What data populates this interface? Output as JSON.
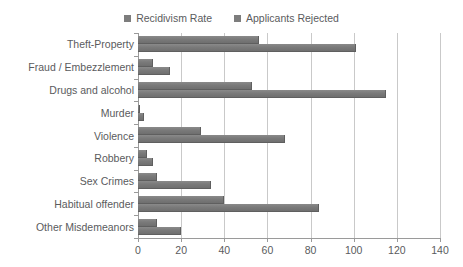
{
  "chart_data": {
    "type": "bar",
    "orientation": "horizontal",
    "title": "",
    "subtitle": "",
    "xlabel": "",
    "ylabel": "",
    "xlim": [
      0,
      140
    ],
    "xticks": [
      0,
      20,
      40,
      60,
      80,
      100,
      120,
      140
    ],
    "tick_labels": [
      "0",
      "20",
      "40",
      "60",
      "80",
      "100",
      "120",
      "140"
    ],
    "grid": "vertical",
    "legend_position": "top-center",
    "categories": [
      "Theft-Property",
      "Fraud / Embezzlement",
      "Drugs and alcohol",
      "Murder",
      "Violence",
      "Robbery",
      "Sex Crimes",
      "Habitual offender",
      "Other Misdemeanors"
    ],
    "series": [
      {
        "name": "Recidivism Rate",
        "color": "#7d7d7d",
        "values": [
          56,
          7,
          53,
          1,
          29,
          4,
          9,
          40,
          9
        ]
      },
      {
        "name": "Applicants Rejected",
        "color": "#7d7d7d",
        "values": [
          101,
          15,
          115,
          3,
          68,
          7,
          34,
          84,
          20
        ]
      }
    ]
  },
  "legend": {
    "entries": [
      {
        "label": "Recidivism Rate",
        "color": "#7d7d7d"
      },
      {
        "label": "Applicants Rejected",
        "color": "#7d7d7d"
      }
    ]
  },
  "axis": {
    "gridline_color": "#c9c9c9",
    "axis_color": "#9a9a9a"
  }
}
